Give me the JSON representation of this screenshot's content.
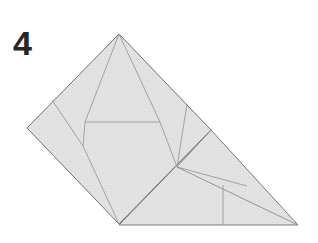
{
  "figure": {
    "step_label": "4",
    "kind": "origami-fold-diagram",
    "caption": "",
    "background_color": "#ffffff"
  },
  "style": {
    "paper_fill": "#e2e2e2",
    "paper_fill_light": "#e8e8e8",
    "outline_color": "#6f6f6f",
    "crease_color": "#9a9a9a",
    "outline_width": "1",
    "crease_width": "0.8",
    "label_color": "#262626"
  },
  "geometry": {
    "square": {
      "name": "folded-square-body",
      "points": "119,34 211,130 119,224 27,128"
    },
    "flap": {
      "name": "lower-right-flap",
      "points": "211,130 298,225 119,225"
    },
    "creases": [
      {
        "name": "crease-apex-to-left-node",
        "points": "119,34 85,122"
      },
      {
        "name": "crease-apex-to-right-node",
        "points": "119,34 160,122"
      },
      {
        "name": "crease-horizontal-band",
        "points": "85,122 160,122"
      },
      {
        "name": "crease-left-upper-diagonal",
        "points": "52,100 83,146"
      },
      {
        "name": "crease-left-node-down",
        "points": "85,122 83,146"
      },
      {
        "name": "crease-left-node-to-bottom",
        "points": "83,146 119,224"
      },
      {
        "name": "crease-right-node-down",
        "points": "160,122 177,167"
      },
      {
        "name": "crease-right-upper-diagonal",
        "points": "187,104 177,167"
      },
      {
        "name": "crease-node-to-square-right",
        "points": "177,167 211,130"
      },
      {
        "name": "crease-node-to-flap-edge",
        "points": "177,167 247,186"
      },
      {
        "name": "crease-node-to-bottom-right",
        "points": "177,167 298,225"
      },
      {
        "name": "crease-flap-vertical",
        "points": "223,185 223,225"
      }
    ]
  },
  "labels": {
    "step": "4"
  }
}
